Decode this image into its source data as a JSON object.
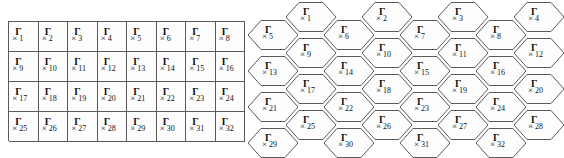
{
  "figure": {
    "background_color": "#ffffff",
    "line_color": "#5a5a5a",
    "cell_fill_color": "#fdfdfd",
    "text_color": "#111111",
    "glyph": {
      "gamma": "Γ",
      "x": "×"
    }
  },
  "square_grid": {
    "name": "rectangular-cell-layout",
    "columns": 8,
    "rows": 4,
    "cell_width_px": 29.6,
    "cell_height_px": 30,
    "rows_data": [
      [
        "1",
        "2",
        "3",
        "4",
        "5",
        "6",
        "7",
        "8"
      ],
      [
        "9",
        "10",
        "11",
        "12",
        "13",
        "14",
        "15",
        "16"
      ],
      [
        "17",
        "18",
        "19",
        "20",
        "21",
        "22",
        "23",
        "24"
      ],
      [
        "25",
        "26",
        "27",
        "28",
        "29",
        "30",
        "31",
        "32"
      ]
    ]
  },
  "hex_grid": {
    "name": "hexagonal-cell-layout",
    "columns": 8,
    "rows": 4,
    "hex_width_px": 50,
    "hex_height_px": 30,
    "rows_data": [
      [
        "1",
        "2",
        "3",
        "4",
        "5",
        "6",
        "7",
        "8"
      ],
      [
        "9",
        "10",
        "11",
        "12",
        "13",
        "14",
        "15",
        "16"
      ],
      [
        "17",
        "18",
        "19",
        "20",
        "21",
        "22",
        "23",
        "24"
      ],
      [
        "25",
        "26",
        "27",
        "28",
        "29",
        "30",
        "31",
        "32"
      ]
    ],
    "cells": [
      {
        "label": "1",
        "x": 28,
        "y": 0
      },
      {
        "label": "2",
        "x": 104,
        "y": 0
      },
      {
        "label": "3",
        "x": 180,
        "y": 0
      },
      {
        "label": "4",
        "x": 256,
        "y": 0
      },
      {
        "label": "5",
        "x": -10,
        "y": 18
      },
      {
        "label": "6",
        "x": 66,
        "y": 18
      },
      {
        "label": "7",
        "x": 142,
        "y": 18
      },
      {
        "label": "8",
        "x": 218,
        "y": 18
      },
      {
        "label": "9",
        "x": 28,
        "y": 36
      },
      {
        "label": "10",
        "x": 104,
        "y": 36
      },
      {
        "label": "11",
        "x": 180,
        "y": 36
      },
      {
        "label": "12",
        "x": 256,
        "y": 36
      },
      {
        "label": "13",
        "x": -10,
        "y": 54
      },
      {
        "label": "14",
        "x": 66,
        "y": 54
      },
      {
        "label": "15",
        "x": 142,
        "y": 54
      },
      {
        "label": "16",
        "x": 218,
        "y": 54
      },
      {
        "label": "17",
        "x": 28,
        "y": 72
      },
      {
        "label": "18",
        "x": 104,
        "y": 72
      },
      {
        "label": "19",
        "x": 180,
        "y": 72
      },
      {
        "label": "20",
        "x": 256,
        "y": 72
      },
      {
        "label": "21",
        "x": -10,
        "y": 90
      },
      {
        "label": "22",
        "x": 66,
        "y": 90
      },
      {
        "label": "23",
        "x": 142,
        "y": 90
      },
      {
        "label": "24",
        "x": 218,
        "y": 90
      },
      {
        "label": "25",
        "x": 28,
        "y": 108
      },
      {
        "label": "26",
        "x": 104,
        "y": 108
      },
      {
        "label": "27",
        "x": 180,
        "y": 108
      },
      {
        "label": "28",
        "x": 256,
        "y": 108
      },
      {
        "label": "29",
        "x": -10,
        "y": 126
      },
      {
        "label": "30",
        "x": 66,
        "y": 126
      },
      {
        "label": "31",
        "x": 142,
        "y": 126
      },
      {
        "label": "32",
        "x": 218,
        "y": 126
      }
    ]
  }
}
